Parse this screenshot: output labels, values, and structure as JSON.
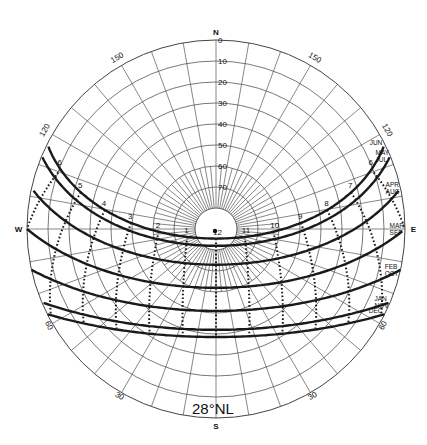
{
  "diagram": {
    "title": "28°NL",
    "latitude": 28,
    "center": {
      "x": 216,
      "y": 229
    },
    "radius": 189,
    "colors": {
      "ink": "#1a1a1a",
      "grid": "#555555",
      "background": "#ffffff"
    },
    "compass": [
      {
        "label": "N",
        "azimuth": 0
      },
      {
        "label": "E",
        "azimuth": 90
      },
      {
        "label": "S",
        "azimuth": 180
      },
      {
        "label": "W",
        "azimuth": 270
      }
    ],
    "altitude_rings": [
      0,
      10,
      20,
      30,
      40,
      50,
      60,
      70,
      80
    ],
    "altitude_labels": [
      "0",
      "10",
      "20",
      "30",
      "40",
      "50",
      "60",
      "70"
    ],
    "bearing_labels": [
      {
        "label": "150",
        "azimuth": 330
      },
      {
        "label": "150",
        "azimuth": 30
      },
      {
        "label": "120",
        "azimuth": 300
      },
      {
        "label": "120",
        "azimuth": 60
      },
      {
        "label": "60",
        "azimuth": 240
      },
      {
        "label": "60",
        "azimuth": 120
      },
      {
        "label": "30",
        "azimuth": 210
      },
      {
        "label": "30",
        "azimuth": 150
      }
    ],
    "sun_paths": [
      {
        "months": [
          "JUN"
        ],
        "declination": 23.45
      },
      {
        "months": [
          "MAY",
          "JUL"
        ],
        "declination": 20.0
      },
      {
        "months": [
          "APR",
          "AUG"
        ],
        "declination": 11.0
      },
      {
        "months": [
          "MAR",
          "SEP"
        ],
        "declination": 0.0
      },
      {
        "months": [
          "FEB",
          "OCT"
        ],
        "declination": -11.0
      },
      {
        "months": [
          "JAN",
          "NOV"
        ],
        "declination": -20.0
      },
      {
        "months": [
          "DEC"
        ],
        "declination": -23.45
      }
    ],
    "hours": [
      {
        "label": "6",
        "hour": 6
      },
      {
        "label": "7",
        "hour": 7
      },
      {
        "label": "8",
        "hour": 8
      },
      {
        "label": "9",
        "hour": 9
      },
      {
        "label": "10",
        "hour": 10
      },
      {
        "label": "11",
        "hour": 11
      },
      {
        "label": "12",
        "hour": 12
      },
      {
        "label": "1",
        "hour": 13
      },
      {
        "label": "2",
        "hour": 14
      },
      {
        "label": "3",
        "hour": 15
      },
      {
        "label": "4",
        "hour": 16
      },
      {
        "label": "5",
        "hour": 17
      },
      {
        "label": "6",
        "hour": 18
      }
    ]
  }
}
